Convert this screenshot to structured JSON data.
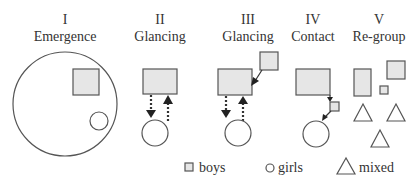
{
  "stages": [
    {
      "numeral": "I",
      "name": "Emergence"
    },
    {
      "numeral": "II",
      "name": "Glancing"
    },
    {
      "numeral": "III",
      "name": "Glancing"
    },
    {
      "numeral": "IV",
      "name": "Contact"
    },
    {
      "numeral": "V",
      "name": "Re-group"
    }
  ],
  "legend": {
    "boys": "boys",
    "girls": "girls",
    "mixed": "mixed"
  },
  "colors": {
    "fill": "#e6e6e6",
    "stroke": "#555555",
    "text": "#333333"
  }
}
